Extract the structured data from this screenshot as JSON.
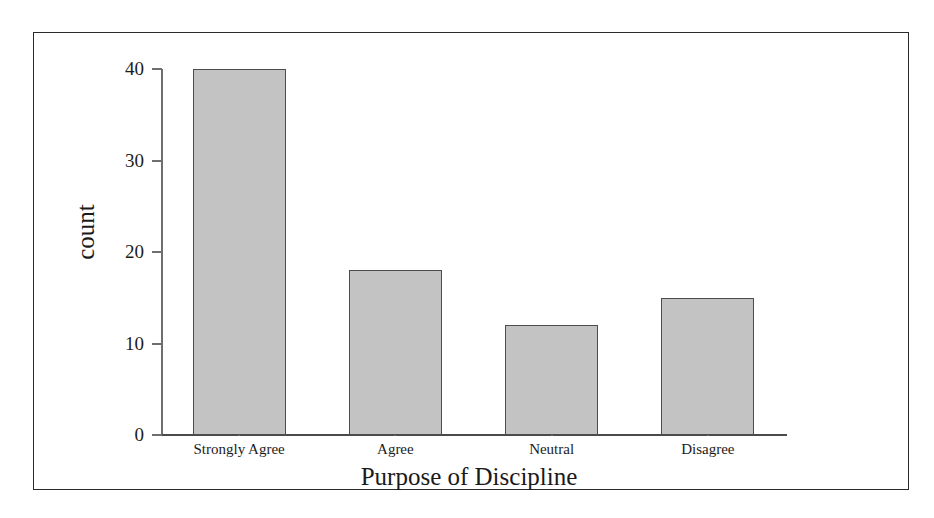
{
  "figure": {
    "background_color": "#ffffff",
    "border_color": "#2b2b2b",
    "bar_fill_color": "#c3c3c3",
    "bar_edge_color": "#4d4d4d",
    "axis_color": "#6f6f6f"
  },
  "chart_data": {
    "type": "bar",
    "title": "",
    "xlabel": "Purpose of Discipline",
    "ylabel": "count",
    "categories": [
      "Strongly Agree",
      "Agree",
      "Neutral",
      "Disagree"
    ],
    "values": [
      40,
      18,
      12,
      15
    ],
    "yticks": [
      0,
      10,
      20,
      30,
      40
    ],
    "ytick_labels": [
      "0",
      "10",
      "20",
      "30",
      "40"
    ],
    "ylim": [
      0,
      40
    ],
    "grid": false,
    "legend": false,
    "legend_position": "none"
  }
}
